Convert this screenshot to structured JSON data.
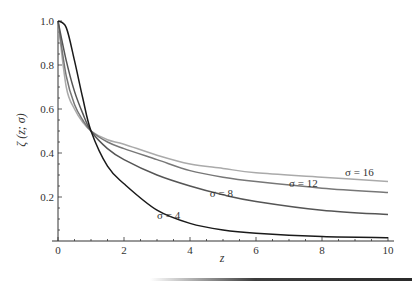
{
  "chart_data": {
    "type": "line",
    "title": "",
    "xlabel": "z",
    "ylabel": "ζ (z; σ)",
    "xlim": [
      0,
      10
    ],
    "ylim": [
      0,
      1.0
    ],
    "grid": false,
    "legend_position": "inline",
    "x_ticks": [
      0,
      2,
      4,
      6,
      8,
      10
    ],
    "y_ticks": [
      0.2,
      0.4,
      0.6,
      0.8,
      1.0
    ],
    "x_tick_labels": [
      "0",
      "2",
      "4",
      "6",
      "8",
      "10"
    ],
    "y_tick_labels": [
      "0.2",
      "0.4",
      "0.6",
      "0.8",
      "1.0"
    ],
    "x": [
      0,
      0.25,
      0.5,
      0.75,
      1,
      1.5,
      2,
      3,
      4,
      5,
      6,
      8,
      10
    ],
    "series": [
      {
        "name": "σ = 4",
        "color": "#1a1a1a",
        "label_pos": [
          3.0,
          0.1
        ],
        "values": [
          1.0,
          0.97,
          0.82,
          0.65,
          0.5,
          0.34,
          0.26,
          0.14,
          0.08,
          0.05,
          0.035,
          0.02,
          0.015
        ]
      },
      {
        "name": "σ = 8",
        "color": "#555555",
        "label_pos": [
          4.6,
          0.2
        ],
        "values": [
          1.0,
          0.82,
          0.68,
          0.58,
          0.5,
          0.42,
          0.37,
          0.3,
          0.25,
          0.21,
          0.18,
          0.14,
          0.12
        ]
      },
      {
        "name": "σ = 12",
        "color": "#777777",
        "label_pos": [
          7.0,
          0.245
        ],
        "values": [
          1.0,
          0.75,
          0.62,
          0.55,
          0.5,
          0.45,
          0.42,
          0.37,
          0.32,
          0.29,
          0.27,
          0.24,
          0.22
        ]
      },
      {
        "name": "σ = 16",
        "color": "#aaaaaa",
        "label_pos": [
          8.7,
          0.295
        ],
        "values": [
          1.0,
          0.7,
          0.6,
          0.54,
          0.5,
          0.46,
          0.44,
          0.39,
          0.35,
          0.33,
          0.31,
          0.29,
          0.27
        ]
      }
    ]
  }
}
